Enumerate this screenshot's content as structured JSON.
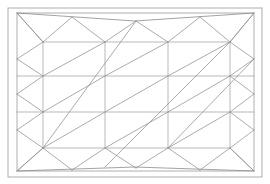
{
  "figure": {
    "title": "Triangulated wireframe mesh panel",
    "kind": "line-drawing",
    "background_color": "#ffffff",
    "line_color": "#8a8a8a",
    "frame_color": "#9a9a9a",
    "canvas": {
      "width": 270,
      "height": 184
    }
  },
  "geometry": {
    "outer_frame": {
      "x1": 8,
      "y1": 8,
      "x2": 262,
      "y2": 177
    },
    "inner_frame": {
      "x1": 17,
      "y1": 13,
      "x2": 254,
      "y2": 171
    },
    "grid_columns_x": [
      17,
      43,
      105,
      168,
      230,
      254
    ],
    "grid_rows_y": [
      13,
      42,
      76,
      112,
      148,
      171
    ],
    "top_chord": {
      "left_x": 17,
      "left_y": 13,
      "mid_x": 135,
      "mid_y": 21,
      "right_x": 254,
      "right_y": 13
    },
    "bottom_chord": {
      "left_x": 17,
      "left_y": 171,
      "mid_x": 135,
      "mid_y": 167,
      "right_x": 254,
      "right_y": 171
    },
    "top_fan_nodes_x": [
      43,
      105,
      168,
      230
    ],
    "bottom_fan_nodes_x": [
      43,
      105,
      168,
      230
    ],
    "left_zigzag_nodes_y": [
      42,
      76,
      112,
      148
    ],
    "right_zigzag_nodes_y": [
      42,
      76,
      112,
      148
    ],
    "middle_cell_diagonal_direction": "bottom-left-to-top-right",
    "horizontal_rails_y": [
      42,
      76,
      112,
      148
    ],
    "vertical_posts_x": [
      43,
      105,
      168,
      230
    ]
  },
  "labels": {
    "none_visible": ""
  }
}
